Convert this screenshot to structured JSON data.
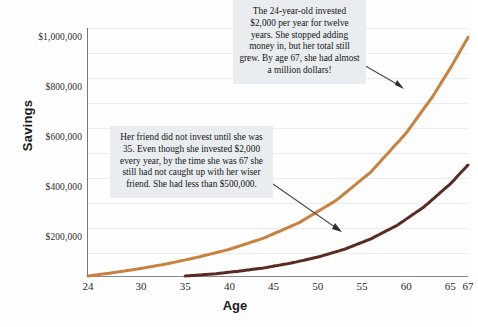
{
  "chart_data": {
    "type": "line",
    "title": "",
    "xlabel": "Age",
    "ylabel": "Savings",
    "xlim": [
      24,
      67
    ],
    "ylim": [
      0,
      1050000
    ],
    "grid": true,
    "legend": "none",
    "x_tick_labels": [
      "24",
      "30",
      "35",
      "40",
      "45",
      "50",
      "55",
      "60",
      "65",
      "67"
    ],
    "x_tick_values": [
      24,
      30,
      35,
      40,
      45,
      50,
      55,
      60,
      65,
      67
    ],
    "y_tick_labels": [
      "$200,000",
      "$400,000",
      "$600,000",
      "$800,000",
      "$1,000,000"
    ],
    "y_tick_values": [
      200000,
      400000,
      600000,
      800000,
      1000000
    ],
    "series": [
      {
        "name": "early-investor",
        "color": "#c8813f",
        "x": [
          24,
          27,
          30,
          33,
          36,
          40,
          44,
          48,
          52,
          56,
          60,
          63,
          65,
          67
        ],
        "values": [
          0,
          15000,
          32000,
          52000,
          76000,
          113000,
          162000,
          228000,
          318000,
          440000,
          605000,
          760000,
          880000,
          1010000
        ]
      },
      {
        "name": "late-investor",
        "color": "#5a2b22",
        "x": [
          35,
          38,
          41,
          44,
          47,
          50,
          53,
          56,
          59,
          62,
          65,
          67
        ],
        "values": [
          0,
          8000,
          20000,
          35000,
          55000,
          80000,
          113000,
          157000,
          215000,
          292000,
          390000,
          470000
        ]
      }
    ],
    "annotations": [
      {
        "id": "callout-one",
        "text": "The 24-year-old invested $2,000 per year for twelve years. She stopped adding money in, but her total still grew. By age 67, she had almost a million dollars!",
        "target_series": "early-investor"
      },
      {
        "id": "callout-two",
        "text": "Her friend did not invest until she was 35. Even though she invested $2,000 every year, by the time she was 67 she still had not caught up with her wiser friend. She had less than $500,000.",
        "target_series": "late-investor"
      }
    ],
    "colors": {
      "early_line": "#c8813f",
      "late_line": "#5a2b22",
      "callout_background": "#e9edef",
      "gridline": "#ececec",
      "axis": "#808080",
      "arrow": "#4a4a4a",
      "text": "#151515"
    }
  }
}
